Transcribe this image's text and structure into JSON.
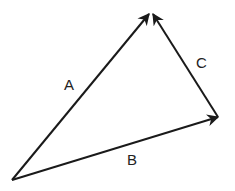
{
  "diagram": {
    "type": "vector-triangle",
    "stroke_color": "#1a1a1a",
    "vectors": [
      {
        "name": "A",
        "from": [
          12,
          180
        ],
        "to": [
          149,
          14
        ],
        "label_pos": [
          64,
          90
        ]
      },
      {
        "name": "B",
        "from": [
          12,
          180
        ],
        "to": [
          218,
          117
        ],
        "label_pos": [
          127,
          165
        ]
      },
      {
        "name": "C",
        "from": [
          218,
          117
        ],
        "to": [
          153,
          14
        ],
        "label_pos": [
          196,
          68
        ]
      }
    ]
  }
}
